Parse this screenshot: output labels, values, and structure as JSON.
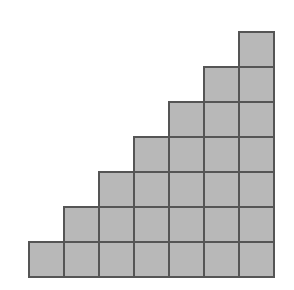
{
  "diagram": {
    "type": "staircase-grid",
    "rows": 7,
    "cols": 7,
    "columns_heights": [
      1,
      2,
      3,
      4,
      5,
      6,
      7
    ],
    "total_squares": 28,
    "origin": {
      "x": 29,
      "y": 32
    },
    "cell_size": 35,
    "colors": {
      "fill": "#b8b8b8",
      "stroke": "#555555",
      "background": "#ffffff"
    }
  }
}
